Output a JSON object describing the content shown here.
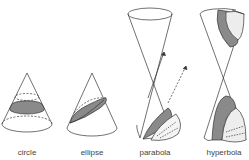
{
  "diagram": {
    "stroke_color": "#333333",
    "section_fill": "#8a8a8a",
    "cut_fill": "#e8e8e8",
    "figures": [
      {
        "id": "circle",
        "label": "circle",
        "label_x": 27
      },
      {
        "id": "ellipse",
        "label": "ellipse",
        "label_x": 92
      },
      {
        "id": "parabola",
        "label": "parabola",
        "label_x": 155
      },
      {
        "id": "hyperbola",
        "label": "hyperbola",
        "label_x": 224
      }
    ]
  }
}
